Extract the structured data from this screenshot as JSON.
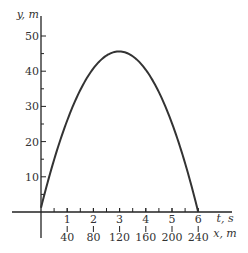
{
  "chart_data": {
    "type": "line",
    "title": "",
    "xlabel": "t, s",
    "xlabel2": "x, m",
    "ylabel": "y, m",
    "xlim": [
      0,
      6
    ],
    "ylim": [
      0,
      50
    ],
    "x_ticks": [
      1,
      2,
      3,
      4,
      5,
      6
    ],
    "x_tick_labels": [
      "1",
      "2",
      "3",
      "4",
      "5",
      "6"
    ],
    "x2_tick_labels": [
      "40",
      "80",
      "120",
      "160",
      "200",
      "240"
    ],
    "y_ticks": [
      10,
      20,
      30,
      40,
      50
    ],
    "y_tick_labels": [
      "10",
      "20",
      "30",
      "40",
      "50"
    ],
    "grid": false,
    "legend": "none",
    "series": [
      {
        "name": "trajectory",
        "x": [
          0,
          0.5,
          1,
          1.5,
          2,
          2.5,
          3,
          3.5,
          4,
          4.5,
          5,
          5.5,
          6
        ],
        "y": [
          0,
          13.75,
          25,
          33.75,
          40,
          43.75,
          45,
          43.75,
          40,
          33.75,
          25,
          13.75,
          0
        ]
      }
    ]
  }
}
